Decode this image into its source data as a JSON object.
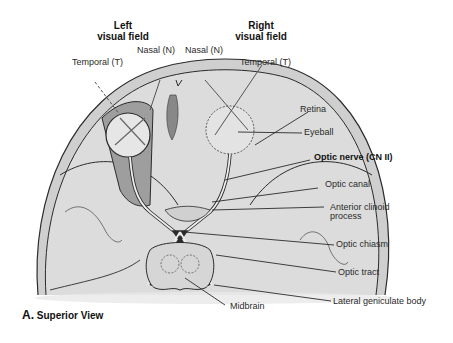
{
  "figure": {
    "caption_letter": "A.",
    "caption_text": "Superior View"
  },
  "visual_fields": {
    "left": {
      "line1": "Left",
      "line2": "visual field"
    },
    "right": {
      "line1": "Right",
      "line2": "visual field"
    }
  },
  "labels": {
    "temporal_left": "Temporal (T)",
    "nasal_left": "Nasal (N)",
    "nasal_right": "Nasal (N)",
    "temporal_right": "Temporal (T)",
    "retina": "Retina",
    "eyeball": "Eyeball",
    "optic_nerve": "Optic nerve (CN II)",
    "optic_canal": "Optic canal",
    "anterior_clinoid_1": "Anterior clinoid",
    "anterior_clinoid_2": "process",
    "optic_chiasm": "Optic chiasm",
    "optic_tract": "Optic tract",
    "lateral_geniculate": "Lateral geniculate body",
    "midbrain": "Midbrain"
  },
  "colors": {
    "skull_fill": "#d9d9d9",
    "bone_band": "#c8c8c8",
    "dark_line": "#2b2b2b",
    "eye_fill": "#e6e6e6",
    "orbit_fill": "#9e9e9e"
  }
}
